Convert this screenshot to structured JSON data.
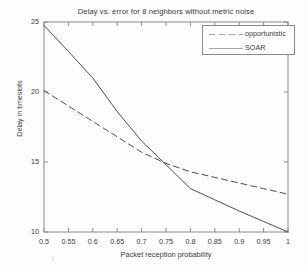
{
  "chart_data": {
    "type": "line",
    "title": "Delay vs. error for 8 neighbors without metric noise",
    "xlabel": "Packet reception probability",
    "ylabel": "Delay in timeslots",
    "xlim": [
      0.5,
      1.0
    ],
    "ylim": [
      10,
      25
    ],
    "xticks": [
      0.5,
      0.55,
      0.6,
      0.65,
      0.7,
      0.75,
      0.8,
      0.85,
      0.9,
      0.95,
      1
    ],
    "xtick_labels": [
      "0.5",
      "0.55",
      "0.6",
      "0.65",
      "0.7",
      "0.75",
      "0.8",
      "0.85",
      "0.9",
      "0.95",
      "1"
    ],
    "yticks": [
      10,
      15,
      20,
      25
    ],
    "ytick_labels": [
      "10",
      "15",
      "20",
      "25"
    ],
    "grid": false,
    "legend_position": "top-right",
    "series": [
      {
        "name": "opportunistic",
        "style": "dashed",
        "color": "#4d4d4d",
        "x": [
          0.5,
          0.55,
          0.6,
          0.65,
          0.7,
          0.75,
          0.8,
          0.85,
          0.9,
          0.95,
          1.0
        ],
        "values": [
          20.1,
          19.0,
          17.9,
          16.8,
          15.7,
          14.9,
          14.3,
          13.9,
          13.5,
          13.1,
          12.7
        ]
      },
      {
        "name": "SOAR",
        "style": "solid",
        "color": "#4d4d4d",
        "x": [
          0.5,
          0.55,
          0.6,
          0.65,
          0.7,
          0.75,
          0.8,
          0.85,
          0.9,
          0.95,
          1.0
        ],
        "values": [
          24.75,
          22.9,
          21.0,
          18.6,
          16.5,
          14.8,
          13.1,
          12.3,
          11.5,
          10.75,
          10.0
        ]
      }
    ]
  },
  "legend": {
    "entries": [
      {
        "label": "opportunistic"
      },
      {
        "label": "SOAR"
      }
    ]
  }
}
